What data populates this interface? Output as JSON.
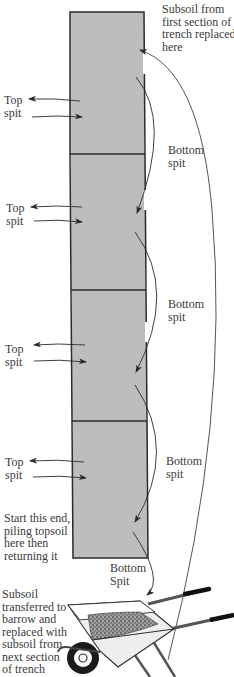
{
  "diagram": {
    "colors": {
      "trench_fill": "#bdbdbd",
      "trench_border": "#2b2b2b",
      "arrow": "#2b2b2b",
      "text": "#3b3b3b"
    },
    "sections": [
      {
        "id": 1,
        "top_label": [
          "Top",
          "spit"
        ],
        "bottom_label": [
          "Bottom",
          "spit"
        ]
      },
      {
        "id": 2,
        "top_label": [
          "Top",
          "spit"
        ],
        "bottom_label": [
          "Bottom",
          "spit"
        ]
      },
      {
        "id": 3,
        "top_label": [
          "Top",
          "spit"
        ],
        "bottom_label": [
          "Bottom",
          "spit"
        ]
      },
      {
        "id": 4,
        "top_label": [
          "Top",
          "spit"
        ],
        "bottom_label": [
          "Bottom",
          "Spit"
        ]
      }
    ],
    "labels": {
      "subsoil_replaced": [
        "Subsoil from",
        "first section of",
        "trench replaced",
        "here"
      ],
      "start_end": [
        "Start this end,",
        "piling topsoil",
        "here then",
        "returning it"
      ],
      "barrow_note": [
        "Subsoil",
        "transferred to",
        "barrow and",
        "replaced with",
        "subsoil from",
        "next section",
        "of trench"
      ]
    },
    "icons": {
      "wheelbarrow": "wheelbarrow-icon"
    }
  }
}
